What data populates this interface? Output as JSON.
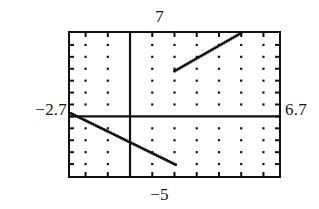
{
  "screen": {
    "title": "graphing-calculator-window",
    "background_color": "#ffffff",
    "ink_color": "#111111"
  },
  "labels": {
    "y_max": "7",
    "y_min": "−5",
    "x_min": "−2.7",
    "x_max": "6.7"
  },
  "chart_data": {
    "type": "line",
    "title": "",
    "xlabel": "",
    "ylabel": "",
    "xlim": [
      -2.7,
      6.7
    ],
    "ylim": [
      -5,
      7
    ],
    "grid": true,
    "grid_style": "dotted-tickmarks",
    "grid_x_step": 1,
    "grid_y_step": 1,
    "axes": {
      "x_axis_at_y": 0,
      "y_axis_at_x": 0,
      "show_x_axis": true,
      "show_y_axis": true
    },
    "legend": null,
    "series": [
      {
        "name": "upper-branch",
        "type": "line",
        "points": [
          [
            2.0,
            3.8
          ],
          [
            5.0,
            7.0
          ]
        ]
      },
      {
        "name": "lower-branch",
        "type": "line",
        "points": [
          [
            -2.65,
            0.25
          ],
          [
            2.05,
            -4.05
          ]
        ]
      }
    ]
  }
}
